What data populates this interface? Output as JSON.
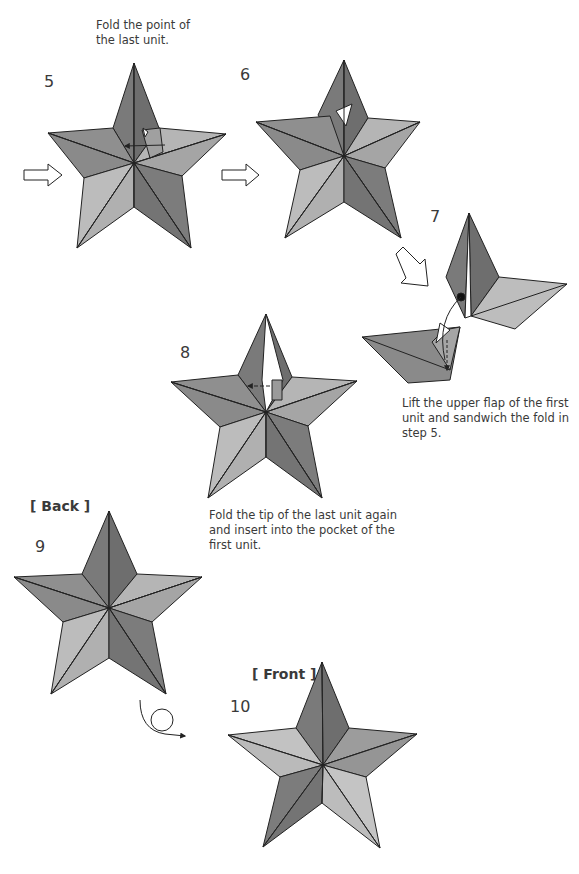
{
  "steps": [
    {
      "number": "5",
      "caption": "Fold the point of\nthe last unit."
    },
    {
      "number": "6"
    },
    {
      "number": "7",
      "caption": "Lift the upper flap of the first unit and sandwich the fold in step 5."
    },
    {
      "number": "8",
      "caption": "Fold the tip of the last unit again and insert into the pocket of the first unit."
    },
    {
      "number": "9",
      "view_label": "[ Back ]"
    },
    {
      "number": "10",
      "view_label": "[ Front ]"
    }
  ],
  "caption5_line1": "Fold the point of",
  "caption5_line2": "the last unit.",
  "caption7_line1": "Lift the upper flap of the first",
  "caption7_line2": "unit and sandwich the fold in",
  "caption7_line3": "step 5.",
  "caption8_line1": "Fold the tip of the last unit again",
  "caption8_line2": "and insert into the pocket of the",
  "caption8_line3": "first unit.",
  "colors": {
    "dark": "#7a7a7a",
    "mid": "#9a9a9a",
    "light": "#bdbdbd",
    "line": "#222222"
  }
}
